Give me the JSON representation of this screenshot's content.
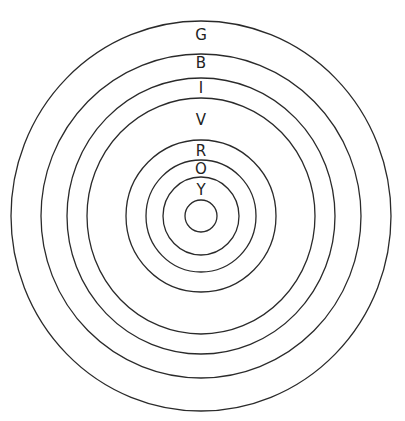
{
  "diagram": {
    "type": "concentric-circles",
    "rings_count": 8,
    "labels": [
      {
        "text": "G",
        "region": "between ring 7 and ring 8"
      },
      {
        "text": "B",
        "region": "between ring 6 and ring 7"
      },
      {
        "text": "I",
        "region": "between ring 5 and ring 6"
      },
      {
        "text": "V",
        "region": "between ring 4 and ring 5"
      },
      {
        "text": "R",
        "region": "between ring 3 and ring 4"
      },
      {
        "text": "O",
        "region": "between ring 2 and ring 3"
      },
      {
        "text": "Y",
        "region": "between ring 1 and ring 2"
      }
    ]
  }
}
